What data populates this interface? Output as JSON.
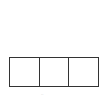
{
  "diagram": {
    "type": "row-of-boxes",
    "cells": [
      {
        "label": ""
      },
      {
        "label": ""
      },
      {
        "label": ""
      }
    ],
    "border_color": "#333333",
    "caption": "··"
  }
}
